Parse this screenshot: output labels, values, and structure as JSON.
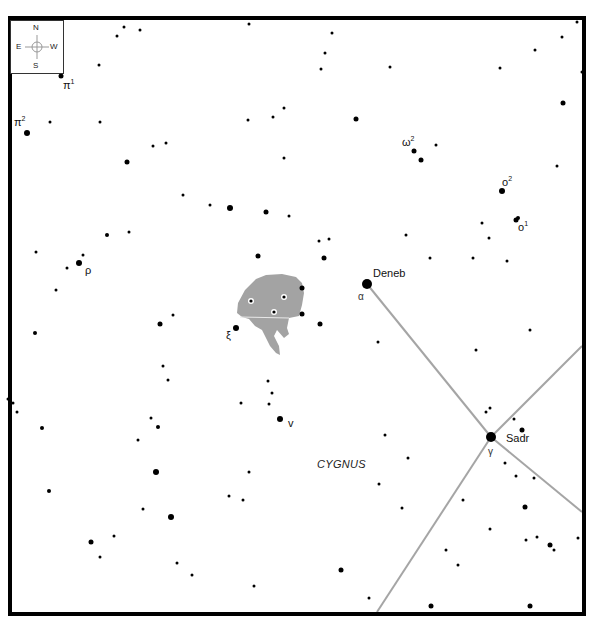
{
  "map": {
    "constellation_label": "CYGNUS",
    "colors": {
      "background": "#ffffff",
      "frame": "#000000",
      "star": "#000000",
      "line": "#a0a0a0",
      "nebula": "#a0a0a0"
    },
    "compass": {
      "north": "N",
      "south": "S",
      "east": "E",
      "west": "W"
    },
    "named_stars": [
      {
        "name": "Deneb",
        "greek": "α"
      },
      {
        "name": "Sadr",
        "greek": "γ"
      }
    ],
    "labels": {
      "pi1": "π",
      "pi1_sup": "1",
      "pi2": "π",
      "pi2_sup": "2",
      "omega2": "ω",
      "omega2_sup": "2",
      "o2": "o",
      "o2_sup": "2",
      "o1": "o",
      "o1_sup": "1",
      "rho": "ρ",
      "xi": "ξ",
      "nu": "v"
    }
  }
}
